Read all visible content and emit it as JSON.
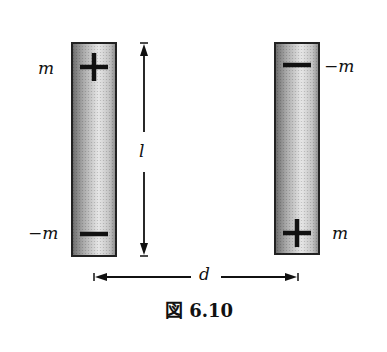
{
  "figure": {
    "caption": "図 6.10",
    "magnets": [
      {
        "id": "left",
        "top_pole": {
          "sign": "+",
          "label": "m"
        },
        "bottom_pole": {
          "sign": "−",
          "label": "−m"
        }
      },
      {
        "id": "right",
        "top_pole": {
          "sign": "−",
          "label": "−m"
        },
        "bottom_pole": {
          "sign": "+",
          "label": "m"
        }
      }
    ],
    "dimensions": {
      "length_label": "l",
      "distance_label": "d"
    }
  }
}
